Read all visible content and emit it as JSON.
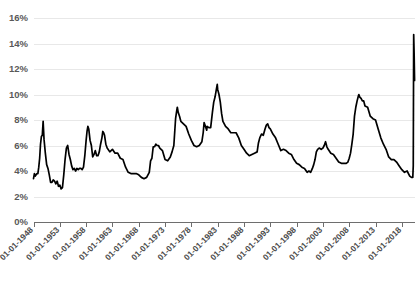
{
  "chart_data": {
    "type": "line",
    "title": "",
    "xlabel": "",
    "ylabel": "",
    "ylim": [
      0,
      16
    ],
    "yticks": [
      0,
      2,
      4,
      6,
      8,
      10,
      12,
      14,
      16
    ],
    "ytick_labels": [
      "0%",
      "2%",
      "4%",
      "6%",
      "8%",
      "10%",
      "12%",
      "14%",
      "16%"
    ],
    "grid": true,
    "legend": "none",
    "xtick_labels": [
      "01-01-1948",
      "01-01-1953",
      "01-01-1958",
      "01-01-1963",
      "01-01-1968",
      "01-01-1973",
      "01-01-1978",
      "01-01-1983",
      "01-01-1988",
      "01-01-1993",
      "01-01-1998",
      "01-01-2003",
      "01-01-2008",
      "01-01-2013",
      "01-01-2018"
    ],
    "xlim_years": [
      1948,
      2020.5
    ],
    "series": [
      {
        "name": "Unemployment rate",
        "color": "#000000",
        "x": [
          1948.0,
          1948.17,
          1948.33,
          1948.5,
          1948.67,
          1948.83,
          1949.0,
          1949.17,
          1949.33,
          1949.5,
          1949.67,
          1949.83,
          1950.0,
          1950.25,
          1950.5,
          1950.75,
          1951.0,
          1951.25,
          1951.5,
          1951.75,
          1952.0,
          1952.25,
          1952.5,
          1952.75,
          1953.0,
          1953.25,
          1953.5,
          1953.75,
          1954.0,
          1954.25,
          1954.5,
          1954.75,
          1955.0,
          1955.25,
          1955.5,
          1955.75,
          1956.0,
          1956.25,
          1956.5,
          1956.75,
          1957.0,
          1957.25,
          1957.5,
          1957.75,
          1958.0,
          1958.17,
          1958.33,
          1958.5,
          1958.75,
          1959.0,
          1959.25,
          1959.5,
          1959.75,
          1960.0,
          1960.25,
          1960.5,
          1960.75,
          1961.0,
          1961.17,
          1961.33,
          1961.5,
          1961.75,
          1962.0,
          1962.5,
          1963.0,
          1963.5,
          1964.0,
          1964.5,
          1965.0,
          1965.5,
          1966.0,
          1966.5,
          1967.0,
          1967.5,
          1968.0,
          1968.5,
          1969.0,
          1969.5,
          1970.0,
          1970.25,
          1970.5,
          1970.75,
          1971.0,
          1971.25,
          1971.5,
          1971.75,
          1972.0,
          1972.5,
          1973.0,
          1973.5,
          1974.0,
          1974.33,
          1974.67,
          1975.0,
          1975.17,
          1975.33,
          1975.5,
          1975.75,
          1976.0,
          1976.5,
          1977.0,
          1977.5,
          1978.0,
          1978.5,
          1979.0,
          1979.5,
          1980.0,
          1980.25,
          1980.42,
          1980.67,
          1980.92,
          1981.0,
          1981.33,
          1981.67,
          1982.0,
          1982.25,
          1982.5,
          1982.75,
          1982.92,
          1983.0,
          1983.25,
          1983.5,
          1983.75,
          1984.0,
          1984.5,
          1985.0,
          1985.5,
          1986.0,
          1986.5,
          1987.0,
          1987.5,
          1988.0,
          1988.5,
          1989.0,
          1989.5,
          1990.0,
          1990.5,
          1990.75,
          1991.0,
          1991.33,
          1991.67,
          1992.0,
          1992.25,
          1992.5,
          1992.75,
          1993.0,
          1993.5,
          1994.0,
          1994.5,
          1995.0,
          1995.5,
          1996.0,
          1996.5,
          1997.0,
          1997.5,
          1998.0,
          1998.5,
          1999.0,
          1999.5,
          2000.0,
          2000.33,
          2000.67,
          2001.0,
          2001.25,
          2001.5,
          2001.75,
          2002.0,
          2002.33,
          2002.67,
          2003.0,
          2003.25,
          2003.5,
          2003.75,
          2004.0,
          2004.5,
          2005.0,
          2005.5,
          2006.0,
          2006.5,
          2007.0,
          2007.42,
          2007.75,
          2008.0,
          2008.25,
          2008.5,
          2008.75,
          2009.0,
          2009.25,
          2009.5,
          2009.75,
          2009.83,
          2010.0,
          2010.25,
          2010.5,
          2010.75,
          2011.0,
          2011.5,
          2012.0,
          2012.5,
          2013.0,
          2013.5,
          2014.0,
          2014.5,
          2015.0,
          2015.5,
          2016.0,
          2016.5,
          2017.0,
          2017.5,
          2018.0,
          2018.5,
          2019.0,
          2019.5,
          2019.83,
          2020.0,
          2020.08,
          2020.17,
          2020.25,
          2020.33,
          2020.42
        ],
        "y": [
          3.4,
          3.8,
          3.6,
          3.7,
          3.8,
          3.8,
          4.3,
          5.0,
          6.1,
          6.7,
          6.8,
          7.9,
          6.5,
          5.4,
          4.5,
          4.2,
          3.7,
          3.1,
          3.1,
          3.3,
          3.2,
          3.0,
          3.2,
          2.8,
          2.9,
          2.6,
          2.7,
          3.7,
          4.9,
          5.8,
          6.0,
          5.3,
          4.9,
          4.4,
          4.1,
          4.2,
          4.0,
          4.2,
          4.1,
          4.2,
          4.2,
          4.1,
          4.3,
          5.2,
          6.4,
          7.1,
          7.5,
          7.3,
          6.4,
          6.0,
          5.1,
          5.3,
          5.6,
          5.2,
          5.2,
          5.5,
          6.1,
          6.6,
          7.1,
          7.0,
          6.8,
          6.1,
          5.8,
          5.5,
          5.7,
          5.4,
          5.4,
          5.0,
          4.9,
          4.3,
          3.9,
          3.8,
          3.8,
          3.8,
          3.7,
          3.5,
          3.4,
          3.5,
          3.9,
          4.8,
          5.0,
          5.9,
          5.9,
          6.1,
          6.0,
          6.0,
          5.8,
          5.6,
          4.9,
          4.8,
          5.1,
          5.5,
          6.0,
          8.1,
          8.6,
          9.0,
          8.6,
          8.3,
          7.9,
          7.7,
          7.5,
          6.9,
          6.4,
          6.0,
          5.9,
          6.0,
          6.3,
          7.0,
          7.8,
          7.5,
          7.2,
          7.5,
          7.4,
          7.4,
          8.6,
          9.4,
          9.8,
          10.4,
          10.8,
          10.4,
          10.0,
          9.4,
          8.5,
          7.9,
          7.5,
          7.3,
          7.0,
          7.0,
          7.0,
          6.6,
          6.0,
          5.7,
          5.4,
          5.2,
          5.3,
          5.4,
          5.5,
          6.2,
          6.6,
          6.9,
          6.8,
          7.3,
          7.6,
          7.7,
          7.4,
          7.3,
          6.9,
          6.6,
          6.1,
          5.6,
          5.7,
          5.6,
          5.4,
          5.3,
          4.9,
          4.6,
          4.5,
          4.3,
          4.2,
          3.9,
          4.0,
          3.9,
          4.2,
          4.5,
          4.9,
          5.5,
          5.7,
          5.8,
          5.7,
          5.8,
          6.0,
          6.3,
          5.9,
          5.7,
          5.4,
          5.3,
          5.0,
          4.7,
          4.6,
          4.6,
          4.6,
          4.7,
          5.0,
          5.4,
          6.1,
          6.9,
          8.3,
          9.0,
          9.5,
          9.9,
          10.0,
          9.8,
          9.7,
          9.5,
          9.5,
          9.1,
          9.0,
          8.3,
          8.1,
          8.0,
          7.3,
          6.6,
          6.1,
          5.7,
          5.1,
          4.9,
          4.9,
          4.7,
          4.4,
          4.1,
          3.9,
          4.0,
          3.6,
          3.5,
          3.5,
          3.5,
          4.4,
          14.7,
          13.3,
          11.1
        ]
      }
    ]
  },
  "axis": {
    "y_labels": [
      "16%",
      "14%",
      "12%",
      "10%",
      "8%",
      "6%",
      "4%",
      "2%",
      "0%"
    ],
    "x_labels": [
      "01-01-1948",
      "01-01-1953",
      "01-01-1958",
      "01-01-1963",
      "01-01-1968",
      "01-01-1973",
      "01-01-1978",
      "01-01-1983",
      "01-01-1988",
      "01-01-1993",
      "01-01-1998",
      "01-01-2003",
      "01-01-2008",
      "01-01-2013",
      "01-01-2018"
    ]
  },
  "colors": {
    "series": "#000000",
    "grid": "#e8e8e8",
    "axis": "#6e6e6e",
    "label": "#595959",
    "background": "#ffffff"
  }
}
